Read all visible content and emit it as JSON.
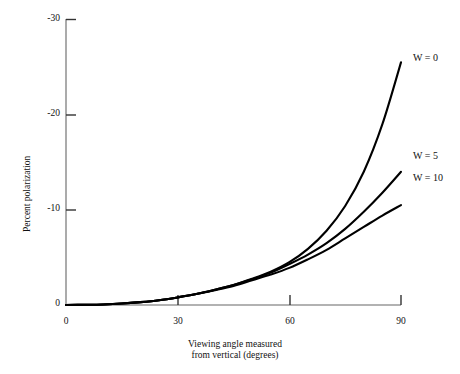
{
  "chart_data": {
    "type": "line",
    "title": "",
    "xlabel": "Viewing angle measured from vertical (degrees)",
    "xlabel_line1": "Viewing angle measured",
    "xlabel_line2": "from vertical (degrees)",
    "ylabel": "Percent polarization",
    "xlim": [
      0,
      90
    ],
    "ylim": [
      0,
      -30
    ],
    "xticks": [
      0,
      30,
      60,
      90
    ],
    "yticks": [
      0,
      -10,
      -20,
      -30
    ],
    "xtick_labels": [
      "0",
      "30",
      "60",
      "90"
    ],
    "ytick_labels": [
      "0",
      "-10",
      "-20",
      "-30"
    ],
    "grid": false,
    "legend_position": "right-inline",
    "line_color": "#000000",
    "axis_color": "#555555",
    "x": [
      0,
      5,
      10,
      15,
      20,
      25,
      30,
      35,
      40,
      45,
      50,
      55,
      60,
      65,
      70,
      75,
      80,
      85,
      90
    ],
    "series": [
      {
        "name": "W = 0",
        "label": "W = 0",
        "values": [
          0,
          -0.02,
          -0.06,
          -0.15,
          -0.3,
          -0.5,
          -0.8,
          -1.15,
          -1.6,
          -2.1,
          -2.75,
          -3.5,
          -4.5,
          -5.9,
          -7.8,
          -10.4,
          -14.0,
          -19.0,
          -25.5
        ]
      },
      {
        "name": "W = 5",
        "label": "W = 5",
        "values": [
          0,
          -0.02,
          -0.06,
          -0.15,
          -0.3,
          -0.5,
          -0.8,
          -1.15,
          -1.6,
          -2.1,
          -2.7,
          -3.4,
          -4.3,
          -5.3,
          -6.5,
          -8.0,
          -9.8,
          -11.8,
          -14.0
        ]
      },
      {
        "name": "W = 10",
        "label": "W = 10",
        "values": [
          0,
          -0.02,
          -0.06,
          -0.15,
          -0.3,
          -0.5,
          -0.8,
          -1.15,
          -1.55,
          -2.0,
          -2.6,
          -3.2,
          -3.9,
          -4.8,
          -5.8,
          -7.0,
          -8.2,
          -9.4,
          -10.5
        ]
      }
    ],
    "annotations": [
      {
        "text": "W = 0",
        "x": 90,
        "y": -25.5
      },
      {
        "text": "W = 5",
        "x": 90,
        "y": -14.0
      },
      {
        "text": "W = 10",
        "x": 90,
        "y": -10.5
      }
    ]
  }
}
